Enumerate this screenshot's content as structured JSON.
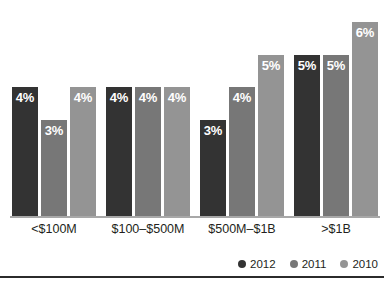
{
  "chart_data": {
    "type": "bar",
    "title": "",
    "subtitle": "",
    "xlabel": "",
    "ylabel": "",
    "grid": false,
    "legend_position": "bottom-right",
    "ylim": [
      0,
      6.5
    ],
    "categories": [
      "<$100M",
      "$100–$500M",
      "$500M–$1B",
      ">$1B"
    ],
    "value_suffix": "%",
    "series": [
      {
        "name": "2012",
        "color": "#333333",
        "values": [
          4,
          4,
          3,
          5
        ],
        "labels": [
          "4%",
          "4%",
          "3%",
          "5%"
        ]
      },
      {
        "name": "2011",
        "color": "#777777",
        "values": [
          3,
          4,
          4,
          5
        ],
        "labels": [
          "3%",
          "4%",
          "4%",
          "5%"
        ]
      },
      {
        "name": "2010",
        "color": "#949494",
        "values": [
          4,
          4,
          5,
          6
        ],
        "labels": [
          "4%",
          "4%",
          "5%",
          "6%"
        ]
      }
    ]
  },
  "legend": {
    "items": [
      {
        "label": "2012",
        "color": "#333333",
        "icon": "legend-dot-icon"
      },
      {
        "label": "2011",
        "color": "#777777",
        "icon": "legend-dot-icon"
      },
      {
        "label": "2010",
        "color": "#949494",
        "icon": "legend-dot-icon"
      }
    ]
  },
  "axis": {
    "baseline_color": "#a8a8a8"
  },
  "colors": {
    "background": "#ffffff",
    "label_text": "#231f20",
    "bar_value_text": "#ffffff",
    "bottom_rule": "#2b2b2b"
  }
}
